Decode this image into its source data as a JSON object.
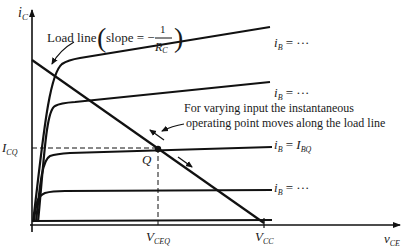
{
  "figure": {
    "y_axis": {
      "var": "i",
      "sub": "C"
    },
    "x_axis": {
      "var": "v",
      "sub": "CE"
    },
    "load_line_label": {
      "prefix": "Load line",
      "slope_text": "slope = −",
      "num": "1",
      "den_var": "R",
      "den_sub": "C"
    },
    "annotation": {
      "line1": "For varying input the instantaneous",
      "line2": "operating point moves along the load line"
    },
    "curves": [
      {
        "label_var": "i",
        "label_sub": "B",
        "label_rest": " = ···"
      },
      {
        "label_var": "i",
        "label_sub": "B",
        "label_rest": " = ···"
      },
      {
        "label_var": "i",
        "label_sub": "B",
        "label_rest": " = ",
        "label_rhs_var": "I",
        "label_rhs_sub": "BQ"
      },
      {
        "label_var": "i",
        "label_sub": "B",
        "label_rest": " = ···"
      }
    ],
    "q_point": {
      "label": "Q"
    },
    "icq": {
      "var": "I",
      "sub": "CQ"
    },
    "vceq": {
      "var": "V",
      "sub": "CEQ"
    },
    "vcc": {
      "var": "V",
      "sub": "CC"
    }
  }
}
